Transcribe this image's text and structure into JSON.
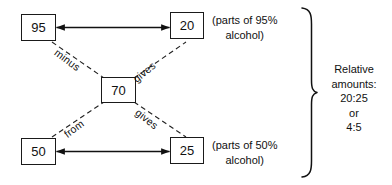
{
  "diagram": {
    "boxes": {
      "top_left": "95",
      "top_right": "20",
      "center": "70",
      "bottom_left": "50",
      "bottom_right": "25"
    },
    "diagonal_labels": {
      "upper_left": "minus",
      "upper_right": "gives",
      "lower_left": "from",
      "lower_right": "gives"
    },
    "notes": {
      "top": {
        "line1": "(parts of 95%",
        "line2": "alcohol)"
      },
      "bottom": {
        "line1": "(parts of 50%",
        "line2": "alcohol)"
      }
    },
    "brace_note": {
      "line1": "Relative",
      "line2": "amounts:",
      "line3": "20:25",
      "line4": "or",
      "line5": "4:5"
    },
    "colors": {
      "ink": "#1a1a1a",
      "background": "#ffffff"
    }
  }
}
